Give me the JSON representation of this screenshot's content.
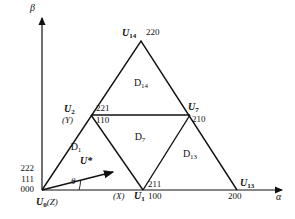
{
  "figure": {
    "type": "space-vector-sector-diagram",
    "axes": {
      "x_label": "α",
      "y_label": "β",
      "origin_label": "U0(Z)"
    },
    "origin_stack": {
      "line1": "222",
      "line2": "111",
      "line3": "000"
    },
    "vertices": [
      {
        "id": "U0",
        "symbol": "U",
        "subscript": "0",
        "alias": "(Z)",
        "codes": [
          "222",
          "111",
          "000"
        ],
        "x": 42,
        "y": 190
      },
      {
        "id": "U1",
        "symbol": "U",
        "subscript": "1",
        "alias": "(X)",
        "codes": [
          "211",
          "100"
        ],
        "x": 143,
        "y": 190
      },
      {
        "id": "U2",
        "symbol": "U",
        "subscript": "2",
        "alias": "(Y)",
        "codes": [
          "221",
          "110"
        ],
        "x": 91,
        "y": 115
      },
      {
        "id": "U7",
        "symbol": "U",
        "subscript": "7",
        "alias": "",
        "codes": [
          "210"
        ],
        "x": 190,
        "y": 115
      },
      {
        "id": "U13",
        "symbol": "U",
        "subscript": "13",
        "alias": "",
        "codes": [
          "200"
        ],
        "x": 237,
        "y": 190
      },
      {
        "id": "U14",
        "symbol": "U",
        "subscript": "14",
        "alias": "",
        "codes": [
          "220"
        ],
        "x": 141,
        "y": 41
      }
    ],
    "vertex_labels": {
      "U14": {
        "name": "U",
        "sub": "14",
        "code": "220"
      },
      "U2": {
        "name": "U",
        "sub": "2",
        "alias": "(Y)",
        "code_top": "221",
        "code_bottom": "110"
      },
      "U7": {
        "name": "U",
        "sub": "7",
        "code": "210"
      },
      "U13": {
        "name": "U",
        "sub": "13",
        "code": "200"
      },
      "U1": {
        "name": "U",
        "sub": "1",
        "alias": "(X)",
        "code_top": "211",
        "code_bottom": "100"
      },
      "U0": {
        "name": "U",
        "sub": "0",
        "alias": "(Z)"
      }
    },
    "regions": [
      {
        "id": "D1",
        "name": "D",
        "sub": "1",
        "x": 76,
        "y": 148
      },
      {
        "id": "D7",
        "name": "D",
        "sub": "7",
        "x": 140,
        "y": 138
      },
      {
        "id": "D13",
        "name": "D",
        "sub": "13",
        "x": 190,
        "y": 155
      },
      {
        "id": "D14",
        "name": "D",
        "sub": "14",
        "x": 141,
        "y": 84
      }
    ],
    "reference_vector": {
      "label": "U*",
      "angle_label": "θ",
      "tip_x": 113,
      "tip_y": 172
    }
  }
}
